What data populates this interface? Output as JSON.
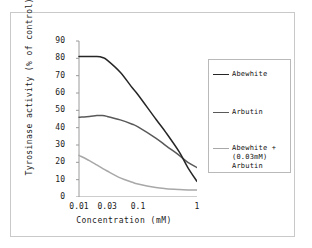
{
  "chart_data": {
    "type": "line",
    "title": "",
    "xlabel": "Concentration (mM)",
    "ylabel": "Tyrosinase activity (% of control)",
    "xscale": "log",
    "xlim": [
      0.01,
      1
    ],
    "ylim": [
      0,
      90
    ],
    "xticks": [
      "0.01",
      "0.03",
      "0.1",
      "1"
    ],
    "xtick_values": [
      0.01,
      0.03,
      0.1,
      1
    ],
    "yticks": [
      "0",
      "10",
      "20",
      "30",
      "40",
      "50",
      "60",
      "70",
      "80",
      "90"
    ],
    "ytick_values": [
      0,
      10,
      20,
      30,
      40,
      50,
      60,
      70,
      80,
      90
    ],
    "grid": false,
    "legend_position": "right",
    "series": [
      {
        "name": "Abewhite",
        "color": "#262626",
        "x": [
          0.01,
          0.015,
          0.02,
          0.025,
          0.03,
          0.05,
          0.08,
          0.1,
          0.2,
          0.3,
          0.5,
          0.7,
          1.0
        ],
        "values": [
          81,
          81,
          81,
          80.5,
          79,
          72,
          63,
          59,
          45,
          37,
          26,
          17,
          9
        ]
      },
      {
        "name": "Arbutin",
        "color": "#595959",
        "x": [
          0.01,
          0.015,
          0.02,
          0.025,
          0.03,
          0.05,
          0.08,
          0.1,
          0.2,
          0.3,
          0.5,
          0.7,
          1.0
        ],
        "values": [
          46,
          46.5,
          47,
          47,
          46.5,
          44.5,
          42,
          40.5,
          34,
          29.5,
          24,
          20,
          17
        ]
      },
      {
        "name": "Abewhite +\n(0.03mM)\nArbutin",
        "color": "#a8a8a8",
        "x": [
          0.01,
          0.015,
          0.02,
          0.025,
          0.03,
          0.05,
          0.08,
          0.1,
          0.2,
          0.3,
          0.5,
          0.7,
          1.0
        ],
        "values": [
          24,
          21,
          18.5,
          16.5,
          15,
          11,
          8.5,
          7.5,
          5.5,
          4.8,
          4.3,
          4.1,
          4
        ]
      }
    ]
  },
  "legend": {
    "items": [
      {
        "label": "Abewhite"
      },
      {
        "label": "Arbutin"
      },
      {
        "label": "Abewhite +\n(0.03mM)\nArbutin"
      }
    ]
  }
}
